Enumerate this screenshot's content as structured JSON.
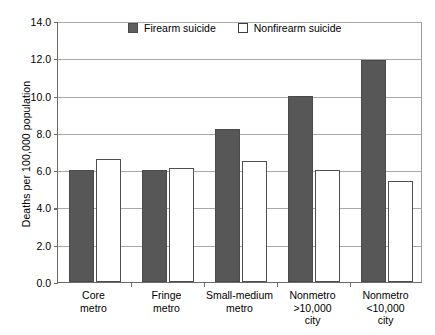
{
  "chart_data": {
    "type": "bar",
    "title": "",
    "subtitle": "",
    "xlabel": "",
    "ylabel": "Deaths per 100,000 population",
    "ylim": [
      0.0,
      14.0
    ],
    "ytick_step": 2.0,
    "ytick_labels": [
      "0.0",
      "2.0",
      "4.0",
      "6.0",
      "8.0",
      "10.0",
      "12.0",
      "14.0"
    ],
    "ytick_values": [
      0.0,
      2.0,
      4.0,
      6.0,
      8.0,
      10.0,
      12.0,
      14.0
    ],
    "grid": true,
    "grid_axis": "y",
    "legend_position": "top-center",
    "categories": [
      "Core metro",
      "Fringe metro",
      "Small-medium metro",
      "Nonmetro >10,000 city",
      "Nonmetro <10,000 city"
    ],
    "category_lines": [
      [
        "Core",
        "metro"
      ],
      [
        "Fringe",
        "metro"
      ],
      [
        "Small-medium",
        "metro"
      ],
      [
        "Nonmetro",
        ">10,000",
        "city"
      ],
      [
        "Nonmetro",
        "<10,000",
        "city"
      ]
    ],
    "series": [
      {
        "name": "Firearm suicide",
        "color": "#575757",
        "values": [
          6.0,
          6.0,
          8.2,
          10.0,
          11.9
        ]
      },
      {
        "name": "Nonfirearm suicide",
        "color": "#ffffff",
        "values": [
          6.6,
          6.1,
          6.5,
          6.0,
          5.4
        ]
      }
    ]
  },
  "legend": {
    "entries": [
      {
        "label": "Firearm suicide",
        "swatch": "filled-gray-square"
      },
      {
        "label": "Nonfirearm suicide",
        "swatch": "outline-white-square"
      }
    ]
  },
  "colors": {
    "firearm_fill": "#575757",
    "nonfirearm_fill": "#ffffff",
    "bar_outline": "#4a4a4a",
    "gridline": "#a8a8a8",
    "axis": "#6b6b6b",
    "text": "#000000",
    "background": "#ffffff"
  }
}
